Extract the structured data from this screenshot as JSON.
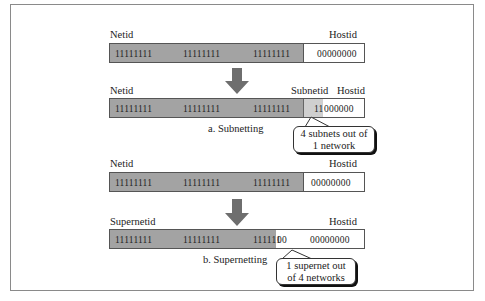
{
  "subnetting": {
    "original": {
      "left_label": "Netid",
      "right_label": "Hostid",
      "net_bits": [
        "11111111",
        "11111111",
        "11111111"
      ],
      "host_bits": "00000000"
    },
    "result": {
      "left_label": "Netid",
      "mid_label": "Subnetid",
      "right_label": "Hostid",
      "net_bits": [
        "11111111",
        "11111111",
        "11111111"
      ],
      "subnet_bits": "11",
      "host_bits": "000000"
    },
    "caption": "a. Subnetting",
    "callout_line1": "4 subnets out of",
    "callout_line2": "1 network"
  },
  "supernetting": {
    "original": {
      "left_label": "Netid",
      "right_label": "Hostid",
      "net_bits": [
        "11111111",
        "11111111",
        "11111111"
      ],
      "host_bits": "00000000"
    },
    "result": {
      "left_label": "Supernetid",
      "right_label": "Hostid",
      "net_bits": [
        "11111111",
        "11111111",
        "111111"
      ],
      "super_bits": "00",
      "host_bits": "00000000"
    },
    "caption": "b. Supernetting",
    "callout_line1": "1 supernet out",
    "callout_line2": "of 4 networks"
  },
  "colors": {
    "net_fill": "#a3a3a3",
    "subnet_fill": "#cfcfcf",
    "arrow_fill": "#6e6e6e",
    "frame": "#8a8a8a"
  }
}
